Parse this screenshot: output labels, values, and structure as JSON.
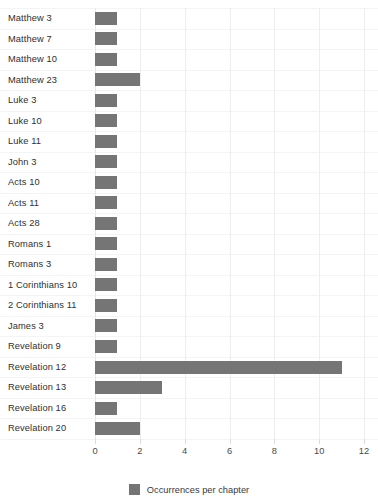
{
  "chart_data": {
    "type": "bar",
    "orientation": "horizontal",
    "title": "",
    "xlabel": "",
    "ylabel": "",
    "xlim": [
      0,
      12
    ],
    "xticks": [
      0,
      2,
      4,
      6,
      8,
      10,
      12
    ],
    "grid": true,
    "legend_position": "bottom",
    "series_name": "Occurrences per chapter",
    "bar_color": "#757575",
    "categories": [
      "Matthew 3",
      "Matthew 7",
      "Matthew 10",
      "Matthew 23",
      "Luke 3",
      "Luke 10",
      "Luke 11",
      "John 3",
      "Acts 10",
      "Acts 11",
      "Acts 28",
      "Romans 1",
      "Romans 3",
      "1 Corinthians 10",
      "2 Corinthians 11",
      "James 3",
      "Revelation 9",
      "Revelation 12",
      "Revelation 13",
      "Revelation 16",
      "Revelation 20"
    ],
    "values": [
      1,
      1,
      1,
      2,
      1,
      1,
      1,
      1,
      1,
      1,
      1,
      1,
      1,
      1,
      1,
      1,
      1,
      11,
      3,
      1,
      2
    ]
  },
  "legend": {
    "label": "Occurrences per chapter"
  },
  "axis": {
    "tick_labels": [
      "0",
      "2",
      "4",
      "6",
      "8",
      "10",
      "12"
    ]
  }
}
